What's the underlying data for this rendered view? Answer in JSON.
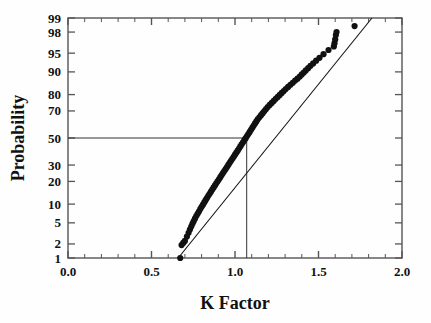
{
  "chart_data": {
    "type": "scatter",
    "title": "",
    "subtitle": "",
    "xlabel": "K Factor",
    "ylabel": "Probability",
    "xlim": [
      0.0,
      2.0
    ],
    "x_major_ticks": [
      0.0,
      0.5,
      1.0,
      1.5,
      2.0
    ],
    "x_major_tick_labels": [
      "0.0",
      "0.5",
      "1.0",
      "1.5",
      "2.0"
    ],
    "x_minor_tick_step": 0.1,
    "y_scale": "normal-probability",
    "ylim": [
      1,
      99
    ],
    "y_ticks": [
      1,
      2,
      5,
      10,
      20,
      30,
      50,
      70,
      80,
      90,
      95,
      98,
      99
    ],
    "y_tick_labels": [
      "1",
      "2",
      "5",
      "10",
      "20",
      "30",
      "50",
      "70",
      "80",
      "90",
      "95",
      "98",
      "99"
    ],
    "grid": false,
    "legend": null,
    "marker": "filled-circle",
    "marker_color": "#111111",
    "line_color": "#111111",
    "frame_color": "#555555",
    "reference_lines": {
      "horizontal_probability": 50,
      "vertical_k_factor": 1.07,
      "note": "median reference lines"
    },
    "fit_line": {
      "x": [
        0.66,
        1.82
      ],
      "probability": [
        1.0,
        99.0
      ]
    },
    "series": [
      {
        "name": "K Factor sample",
        "x": [
          0.672,
          0.68,
          0.69,
          0.7,
          0.712,
          0.722,
          0.73,
          0.738,
          0.745,
          0.752,
          0.76,
          0.768,
          0.776,
          0.784,
          0.792,
          0.8,
          0.808,
          0.816,
          0.824,
          0.832,
          0.84,
          0.848,
          0.856,
          0.864,
          0.872,
          0.88,
          0.888,
          0.896,
          0.904,
          0.912,
          0.92,
          0.928,
          0.936,
          0.944,
          0.952,
          0.96,
          0.968,
          0.976,
          0.984,
          0.992,
          1.0,
          1.008,
          1.016,
          1.024,
          1.032,
          1.04,
          1.048,
          1.056,
          1.064,
          1.072,
          1.08,
          1.088,
          1.096,
          1.104,
          1.112,
          1.12,
          1.128,
          1.136,
          1.146,
          1.156,
          1.166,
          1.176,
          1.186,
          1.196,
          1.208,
          1.22,
          1.232,
          1.244,
          1.256,
          1.268,
          1.28,
          1.292,
          1.304,
          1.318,
          1.332,
          1.346,
          1.36,
          1.374,
          1.388,
          1.4,
          1.412,
          1.424,
          1.438,
          1.452,
          1.468,
          1.486,
          1.506,
          1.53,
          1.56,
          1.592,
          1.596,
          1.6,
          1.604,
          1.608,
          1.716
        ],
        "probability": [
          1.0,
          1.9,
          2.1,
          2.3,
          2.8,
          3.3,
          3.8,
          4.3,
          4.8,
          5.3,
          5.9,
          6.5,
          7.1,
          7.7,
          8.4,
          9.1,
          9.8,
          10.6,
          11.4,
          12.2,
          13.1,
          14.0,
          14.9,
          15.9,
          16.9,
          17.9,
          19.0,
          20.1,
          21.2,
          22.4,
          23.6,
          24.8,
          26.1,
          27.4,
          28.7,
          30.1,
          31.5,
          32.9,
          34.3,
          35.8,
          37.3,
          38.8,
          40.3,
          41.9,
          43.5,
          45.1,
          46.7,
          48.3,
          49.9,
          51.5,
          53.1,
          54.7,
          56.3,
          57.9,
          59.5,
          61.1,
          62.6,
          64.1,
          65.6,
          67.1,
          68.5,
          69.9,
          71.3,
          72.6,
          73.9,
          75.2,
          76.4,
          77.6,
          78.7,
          79.8,
          80.9,
          81.9,
          82.9,
          83.9,
          84.9,
          85.8,
          86.7,
          87.5,
          88.3,
          89.1,
          89.8,
          90.5,
          91.2,
          91.9,
          92.6,
          93.3,
          94.0,
          94.8,
          95.6,
          96.2,
          96.7,
          97.2,
          97.7,
          98.0,
          98.5
        ]
      }
    ]
  },
  "axes": {
    "x_title": "K Factor",
    "y_title": "Probability"
  }
}
